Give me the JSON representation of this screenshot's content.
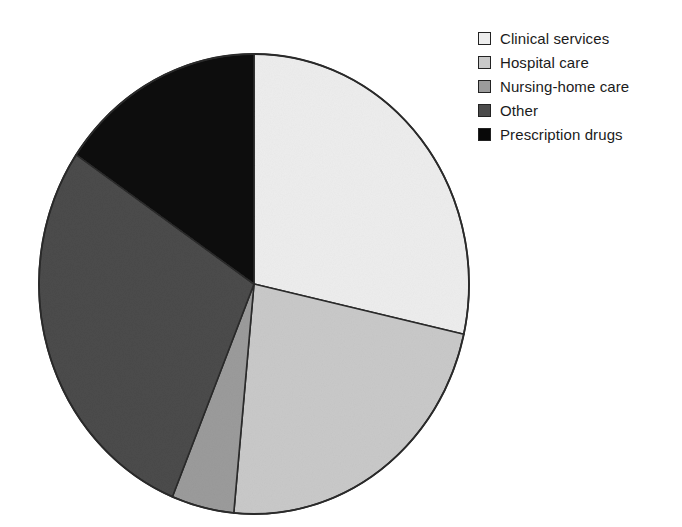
{
  "chart_data": {
    "type": "pie",
    "title": "",
    "subtitle": "",
    "xlabel": "",
    "ylabel": "",
    "grid": false,
    "legend_position": "top-right",
    "start_angle_deg": 0,
    "direction": "clockwise",
    "categories": [
      "Clinical services",
      "Hospital care",
      "Nursing-home care",
      "Other",
      "Prescription drugs"
    ],
    "values": [
      28.5,
      23.0,
      4.7,
      28.3,
      15.5
    ],
    "units": "percent",
    "slices": [
      {
        "label": "Clinical services",
        "value": 28.5,
        "color": "#ededed",
        "start_angle_deg": 0,
        "end_angle_deg": 102.6
      },
      {
        "label": "Hospital care",
        "value": 23.0,
        "color": "#c9c9c9",
        "start_angle_deg": 102.6,
        "end_angle_deg": 185.4
      },
      {
        "label": "Nursing-home care",
        "value": 4.7,
        "color": "#9b9b9b",
        "start_angle_deg": 185.4,
        "end_angle_deg": 202.3
      },
      {
        "label": "Other",
        "value": 28.3,
        "color": "#4b4b4b",
        "start_angle_deg": 202.3,
        "end_angle_deg": 304.2
      },
      {
        "label": "Prescription drugs",
        "value": 15.5,
        "color": "#080808",
        "start_angle_deg": 304.2,
        "end_angle_deg": 360
      }
    ],
    "outline_color": "#2a2a2a",
    "background_color": "#ffffff"
  },
  "legend": {
    "items": [
      {
        "label": "Clinical services",
        "color": "#ededed",
        "swatch_name": "legend-swatch-clinical-services"
      },
      {
        "label": "Hospital care",
        "color": "#c9c9c9",
        "swatch_name": "legend-swatch-hospital-care"
      },
      {
        "label": "Nursing-home care",
        "color": "#9b9b9b",
        "swatch_name": "legend-swatch-nursing-home-care"
      },
      {
        "label": "Other",
        "color": "#4b4b4b",
        "swatch_name": "legend-swatch-other"
      },
      {
        "label": "Prescription drugs",
        "color": "#080808",
        "swatch_name": "legend-swatch-prescription-drugs"
      }
    ]
  }
}
